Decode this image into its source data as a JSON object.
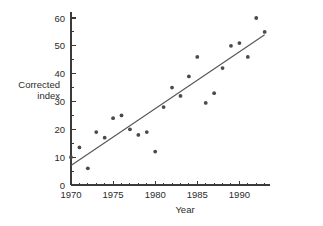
{
  "chart_data": {
    "type": "scatter",
    "title": "",
    "xlabel": "Year",
    "ylabel": "Corrected index",
    "ylabel_line1": "Corrected",
    "ylabel_line2": "index",
    "xlim": [
      1969.2,
      1993.6
    ],
    "ylim": [
      0,
      62
    ],
    "grid": false,
    "legend": "none",
    "marker_color": "#4a4a4a",
    "line_color": "#555555",
    "axis_color": "#3a3a3a",
    "x_ticks_major": [
      1970,
      1975,
      1980,
      1985,
      1990
    ],
    "x_tick_labels": [
      "1970",
      "1975",
      "1980",
      "1985",
      "1990"
    ],
    "x_ticks_minor": [
      1971,
      1972,
      1973,
      1974,
      1976,
      1977,
      1978,
      1979,
      1981,
      1982,
      1983,
      1984,
      1986,
      1987,
      1988,
      1989,
      1991,
      1992,
      1993
    ],
    "y_ticks_major": [
      0,
      10,
      20,
      30,
      40,
      50,
      60
    ],
    "y_tick_labels": [
      "0",
      "10",
      "20",
      "30",
      "40",
      "50",
      "60"
    ],
    "y_ticks_minor": [
      5,
      15,
      25,
      35,
      45,
      55
    ],
    "x": [
      1970,
      1971,
      1972,
      1973,
      1974,
      1975,
      1976,
      1977,
      1978,
      1979,
      1980,
      1981,
      1982,
      1983,
      1984,
      1985,
      1986,
      1987,
      1988,
      1989,
      1990,
      1991,
      1992,
      1993
    ],
    "values": [
      10,
      13.5,
      6,
      19,
      17,
      24,
      25,
      20,
      18,
      19,
      12,
      28,
      35,
      32,
      39,
      46,
      29.5,
      33,
      42,
      50,
      51,
      46,
      60,
      55
    ],
    "points": [
      {
        "x": 1970,
        "y": 10
      },
      {
        "x": 1971,
        "y": 13.5
      },
      {
        "x": 1972,
        "y": 6
      },
      {
        "x": 1973,
        "y": 19
      },
      {
        "x": 1974,
        "y": 17
      },
      {
        "x": 1975,
        "y": 24
      },
      {
        "x": 1976,
        "y": 25
      },
      {
        "x": 1977,
        "y": 20
      },
      {
        "x": 1978,
        "y": 18
      },
      {
        "x": 1979,
        "y": 19
      },
      {
        "x": 1980,
        "y": 12
      },
      {
        "x": 1981,
        "y": 28
      },
      {
        "x": 1982,
        "y": 35
      },
      {
        "x": 1983,
        "y": 32
      },
      {
        "x": 1984,
        "y": 39
      },
      {
        "x": 1985,
        "y": 46
      },
      {
        "x": 1986,
        "y": 29.5
      },
      {
        "x": 1987,
        "y": 33
      },
      {
        "x": 1988,
        "y": 42
      },
      {
        "x": 1989,
        "y": 50
      },
      {
        "x": 1990,
        "y": 51
      },
      {
        "x": 1991,
        "y": 46
      },
      {
        "x": 1992,
        "y": 60
      },
      {
        "x": 1993,
        "y": 55
      }
    ],
    "trend_line": {
      "x_start": 1970,
      "y_start": 7,
      "x_end": 1993,
      "y_end": 54
    }
  }
}
